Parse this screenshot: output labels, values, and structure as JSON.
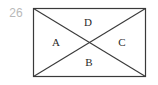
{
  "figure": {
    "problem_number": "26",
    "problem_number_color": "#b9b9b9",
    "stroke_color": "#3a3a3a",
    "background_color": "#ffffff",
    "shape": "rectangle-with-both-diagonals",
    "rectangle": {
      "x": 33,
      "y": 8,
      "width": 113,
      "height": 69
    },
    "diagonals": [
      {
        "name": "top-left-to-bottom-right",
        "x1": 33,
        "y1": 8,
        "x2": 146,
        "y2": 77
      },
      {
        "name": "bottom-left-to-top-right",
        "x1": 33,
        "y1": 77,
        "x2": 146,
        "y2": 8
      }
    ],
    "intersection_point": {
      "x": 89,
      "y": 42
    },
    "regions": [
      {
        "id": "a",
        "label": "A",
        "position": "left"
      },
      {
        "id": "b",
        "label": "B",
        "position": "bottom"
      },
      {
        "id": "c",
        "label": "C",
        "position": "right"
      },
      {
        "id": "d",
        "label": "D",
        "position": "top"
      }
    ]
  }
}
